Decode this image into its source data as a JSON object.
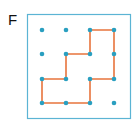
{
  "figure": {
    "label": "F",
    "colors": {
      "frame": "#5bb4d4",
      "dot": "#2a9fc0",
      "path": "#e8743c"
    },
    "grid": {
      "columns": 4,
      "rows": 4,
      "x": [
        42,
        66,
        90,
        114
      ],
      "y": [
        30,
        54,
        79,
        103
      ]
    },
    "frame": {
      "x": 27,
      "y": 14,
      "width": 103,
      "height": 104
    },
    "path_grid_points": [
      [
        2,
        0
      ],
      [
        3,
        0
      ],
      [
        3,
        2
      ],
      [
        2,
        2
      ],
      [
        2,
        3
      ],
      [
        0,
        3
      ],
      [
        0,
        2
      ],
      [
        1,
        2
      ],
      [
        1,
        1
      ],
      [
        2,
        1
      ],
      [
        2,
        0
      ]
    ]
  }
}
